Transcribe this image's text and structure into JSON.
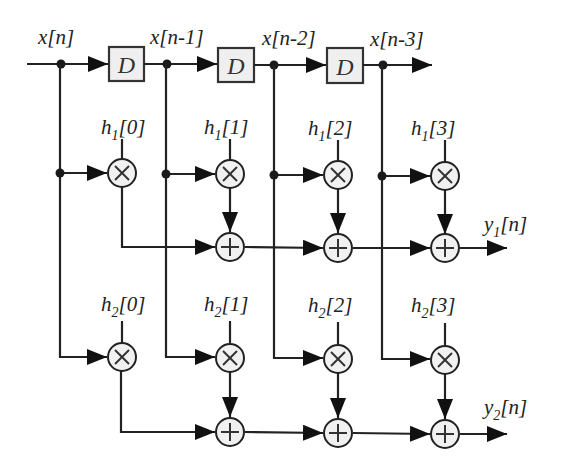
{
  "diagram": {
    "type": "fir-filter-bank-block-diagram",
    "input_label": "x[n]",
    "delay_label": "D",
    "delay_taps": [
      {
        "label": "x[n]"
      },
      {
        "label": "x[n-1]"
      },
      {
        "label": "x[n-2]"
      },
      {
        "label": "x[n-3]"
      }
    ],
    "filters": [
      {
        "name": "filter-1",
        "coefficients": [
          {
            "base": "h",
            "sub": "1",
            "index": "[0]"
          },
          {
            "base": "h",
            "sub": "1",
            "index": "[1]"
          },
          {
            "base": "h",
            "sub": "1",
            "index": "[2]"
          },
          {
            "base": "h",
            "sub": "1",
            "index": "[3]"
          }
        ],
        "output": {
          "base": "y",
          "sub": "1",
          "index": "[n]"
        }
      },
      {
        "name": "filter-2",
        "coefficients": [
          {
            "base": "h",
            "sub": "2",
            "index": "[0]"
          },
          {
            "base": "h",
            "sub": "2",
            "index": "[1]"
          },
          {
            "base": "h",
            "sub": "2",
            "index": "[2]"
          },
          {
            "base": "h",
            "sub": "2",
            "index": "[3]"
          }
        ],
        "output": {
          "base": "y",
          "sub": "2",
          "index": "[n]"
        }
      }
    ],
    "symbols": {
      "multiplier": "multiply-circle",
      "adder": "plus-circle",
      "delay": "delay-box"
    },
    "colors": {
      "line": "#222222",
      "fill": "#efefef",
      "background": "#ffffff"
    }
  }
}
